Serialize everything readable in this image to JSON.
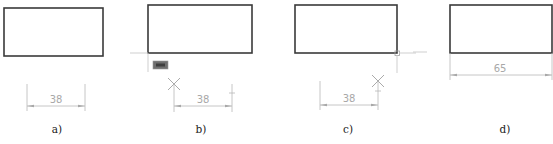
{
  "figure": {
    "panels": [
      {
        "id": "a",
        "label": "a)",
        "dimension_value": "38",
        "state": "dimension placed below rectangle"
      },
      {
        "id": "b",
        "label": "b)",
        "dimension_value": "38",
        "state": "tracking from lower-left corner with tooltip",
        "tooltip_text": "端点"
      },
      {
        "id": "c",
        "label": "c)",
        "dimension_value": "38",
        "state": "tracking from lower-right corner with endpoint snap"
      },
      {
        "id": "d",
        "label": "d)",
        "dimension_value": "65",
        "state": "final dimension spanning full rectangle width"
      }
    ]
  },
  "colors": {
    "rectangle_stroke": "#3a3a3a",
    "dimension_gray": "#a8a8a8",
    "tracking_line": "#c9c9c9",
    "tooltip_fill": "#6f6f6f",
    "label_text": "#222222"
  }
}
